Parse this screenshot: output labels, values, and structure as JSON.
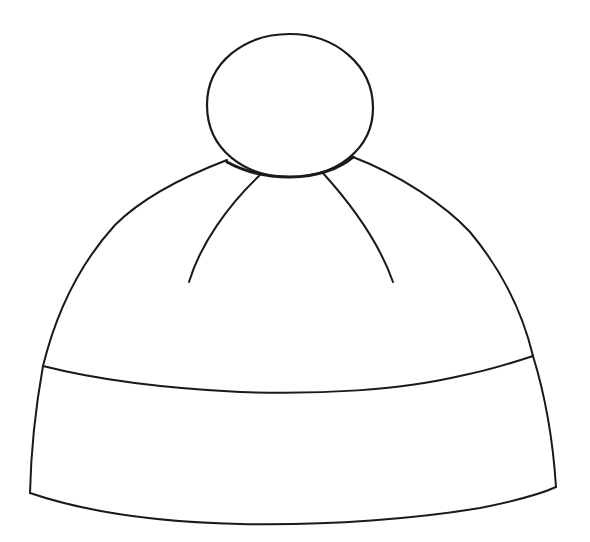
{
  "image": {
    "subject": "Beanie hat with pom-pom line drawing",
    "background_color": "#ffffff",
    "stroke_color": "#1a1a1a",
    "parts": [
      "pom-pom",
      "crown",
      "left-seam",
      "right-seam",
      "brim-band"
    ]
  }
}
